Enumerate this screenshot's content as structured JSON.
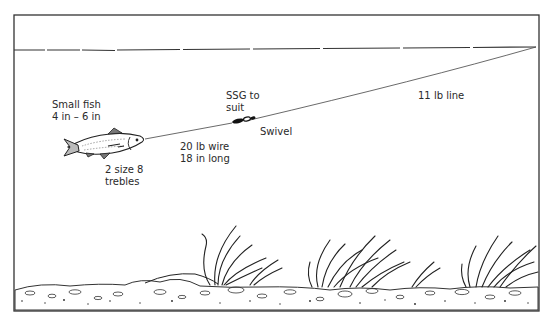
{
  "diagram": {
    "type": "fishing-rig-illustration",
    "frame": {
      "border_color": "#333333",
      "background": "#ffffff"
    },
    "labels": {
      "bait": {
        "line1": "Small fish",
        "line2": "4 in – 6 in"
      },
      "hooks": {
        "line1": "2 size 8",
        "line2": "trebles"
      },
      "trace": {
        "line1": "20 lb wire",
        "line2": "18 in long"
      },
      "weight": {
        "line1": "SSG to",
        "line2": "suit"
      },
      "swivel": {
        "line1": "Swivel"
      },
      "main_line": {
        "line1": "11 lb line"
      }
    },
    "elements": [
      "water-surface",
      "main-line",
      "swivel",
      "split-shot",
      "wire-trace",
      "bait-fish",
      "weed-clumps",
      "river-bed"
    ]
  }
}
